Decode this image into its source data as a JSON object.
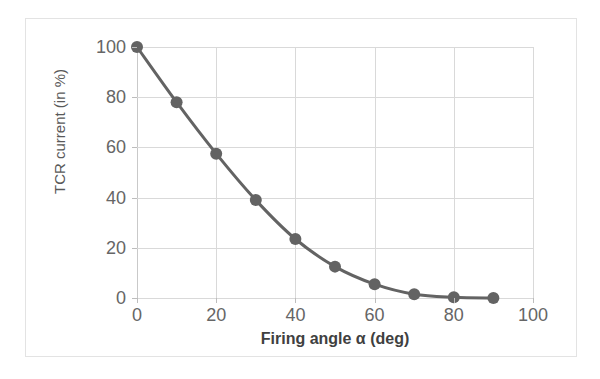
{
  "chart_data": {
    "type": "line",
    "title": "",
    "xlabel": "Firing angle α (deg)",
    "ylabel": "TCR current (in %)",
    "xlim": [
      0,
      100
    ],
    "ylim": [
      0,
      100
    ],
    "xticks": [
      0,
      20,
      40,
      60,
      80,
      100
    ],
    "yticks": [
      0,
      20,
      40,
      60,
      80,
      100
    ],
    "grid": true,
    "legend": "none",
    "marker": "circle",
    "series": [
      {
        "name": "TCR current",
        "color": "#636363",
        "x": [
          0,
          10,
          20,
          30,
          40,
          50,
          60,
          70,
          80,
          90
        ],
        "values": [
          100,
          78,
          57.5,
          39,
          23.5,
          12.5,
          5.5,
          1.5,
          0.3,
          0
        ]
      }
    ]
  },
  "axes": {
    "x_tick_labels": [
      "0",
      "20",
      "40",
      "60",
      "80",
      "100"
    ],
    "y_tick_labels": [
      "0",
      "20",
      "40",
      "60",
      "80",
      "100"
    ],
    "x_title": "Firing angle α (deg)",
    "y_title": "TCR current (in %)"
  },
  "style": {
    "grid_color": "#d9d9d9",
    "frame_color": "#e3e3e3",
    "tick_text_color": "#666666",
    "axis_title_color": "#404040",
    "series_color": "#636363",
    "background": "#ffffff"
  }
}
